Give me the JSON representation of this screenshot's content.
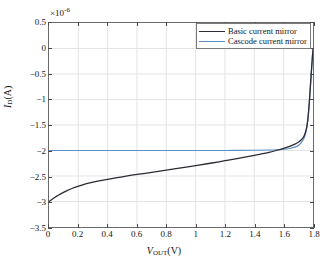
{
  "chart_data": {
    "type": "line",
    "title": "",
    "subtitle": "",
    "xlabel": "V_OUT (V)",
    "ylabel": "I_D (A)",
    "y_exponent_label": "×10",
    "y_exponent_value": "-6",
    "xlim": [
      0,
      1.8
    ],
    "ylim": [
      -3.5,
      0.5
    ],
    "xticks": [
      0,
      0.2,
      0.4,
      0.6,
      0.8,
      1,
      1.2,
      1.4,
      1.6,
      1.8
    ],
    "xtick_labels": [
      "0",
      "0.2",
      "0.4",
      "0.6",
      "0.8",
      "1",
      "1.2",
      "1.4",
      "1.6",
      "1.8"
    ],
    "yticks": [
      0.5,
      0,
      -0.5,
      -1,
      -1.5,
      -2,
      -2.5,
      -3,
      -3.5
    ],
    "ytick_labels": [
      "0.5",
      "0",
      "−0.5",
      "−1",
      "−1.5",
      "−2",
      "−2.5",
      "−3",
      "−3.5"
    ],
    "grid": true,
    "legend_position": "top-right",
    "series": [
      {
        "name": "Basic current mirror",
        "color": "#2b2b33",
        "x": [
          0,
          0.02,
          0.05,
          0.08,
          0.12,
          0.16,
          0.2,
          0.25,
          0.3,
          0.35,
          0.4,
          0.5,
          0.6,
          0.7,
          0.8,
          0.9,
          1.0,
          1.1,
          1.2,
          1.3,
          1.4,
          1.45,
          1.5,
          1.55,
          1.6,
          1.64,
          1.68,
          1.7,
          1.72,
          1.74,
          1.755,
          1.765,
          1.775,
          1.785,
          1.795,
          1.8
        ],
        "values": [
          -3.0,
          -2.96,
          -2.9,
          -2.85,
          -2.79,
          -2.74,
          -2.7,
          -2.655,
          -2.62,
          -2.59,
          -2.565,
          -2.515,
          -2.47,
          -2.43,
          -2.385,
          -2.34,
          -2.295,
          -2.25,
          -2.2,
          -2.15,
          -2.095,
          -2.065,
          -2.035,
          -2.0,
          -1.96,
          -1.92,
          -1.87,
          -1.84,
          -1.79,
          -1.71,
          -1.57,
          -1.38,
          -1.05,
          -0.62,
          -0.2,
          -0.02
        ]
      },
      {
        "name": "Cascode current mirror",
        "color": "#5b8fc4",
        "x": [
          0,
          0.2,
          0.4,
          0.6,
          0.8,
          1.0,
          1.2,
          1.4,
          1.5,
          1.55,
          1.6,
          1.64,
          1.68,
          1.7,
          1.72,
          1.74,
          1.755,
          1.765,
          1.775,
          1.785,
          1.795,
          1.8
        ],
        "values": [
          -2.0,
          -2.0,
          -2.0,
          -2.0,
          -2.0,
          -2.0,
          -2.0,
          -1.995,
          -1.99,
          -1.985,
          -1.975,
          -1.96,
          -1.93,
          -1.9,
          -1.845,
          -1.75,
          -1.6,
          -1.4,
          -1.06,
          -0.63,
          -0.2,
          -0.02
        ]
      }
    ]
  },
  "legend": {
    "entries": [
      {
        "label": "Basic current mirror"
      },
      {
        "label": "Cascode current mirror"
      }
    ]
  },
  "axes": {
    "x_title_symbol": "V",
    "x_title_sub": "OUT",
    "x_title_unit": "(V)",
    "y_title_symbol": "I",
    "y_title_sub": "D",
    "y_title_unit": "(A)"
  }
}
